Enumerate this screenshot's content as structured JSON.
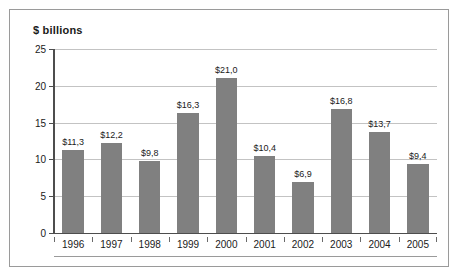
{
  "chart_data": {
    "type": "bar",
    "title": "$ billions",
    "xlabel": "",
    "ylabel": "",
    "categories": [
      "1996",
      "1997",
      "1998",
      "1999",
      "2000",
      "2001",
      "2002",
      "2003",
      "2004",
      "2005"
    ],
    "values": [
      11.3,
      12.2,
      9.8,
      16.3,
      21.0,
      10.4,
      6.9,
      16.8,
      13.7,
      9.4
    ],
    "data_labels": [
      "$11,3",
      "$12,2",
      "$9,8",
      "$16,3",
      "$21,0",
      "$10,4",
      "$6,9",
      "$16,8",
      "$13,7",
      "$9,4"
    ],
    "ylim": [
      0,
      25
    ],
    "ytick_labels": [
      "0",
      "5",
      "10",
      "15",
      "20",
      "25"
    ],
    "ytick_values": [
      0,
      5,
      10,
      15,
      20,
      25
    ],
    "grid": true,
    "legend": false,
    "bar_color": "#808080",
    "gridline_color": "#c3c3c3",
    "axis_color": "#4d4d4d",
    "border_color": "#9a9a9a",
    "background_color": "#ffffff"
  }
}
